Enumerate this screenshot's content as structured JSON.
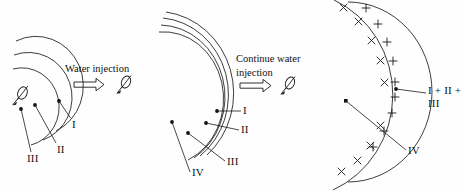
{
  "figure": {
    "background_color": "#fefefe",
    "ink_color": "#111111",
    "width": 463,
    "height": 193
  },
  "panel1": {
    "name": "initial-injection",
    "well_symbol": "well-slashed-circle",
    "arc_count": 3,
    "zone_labels": [
      {
        "id": "I",
        "text": "I"
      },
      {
        "id": "II",
        "text": "II"
      },
      {
        "id": "III",
        "text": "III"
      }
    ],
    "caption": "Water injection",
    "arrow": "block-arrow-right",
    "result_symbol": "well-slashed-circle"
  },
  "panel2": {
    "name": "continued-injection",
    "arc_count": 4,
    "zone_labels": [
      {
        "id": "I",
        "text": "I"
      },
      {
        "id": "II",
        "text": "II"
      },
      {
        "id": "III",
        "text": "III"
      },
      {
        "id": "IV",
        "text": "IV"
      }
    ],
    "caption_line1": "Continue water",
    "caption_line2": "injection",
    "arrow": "block-arrow-right",
    "result_symbol": "well-slashed-circle"
  },
  "panel3": {
    "name": "merged-front",
    "band": {
      "outer_fill_marks": "×",
      "inner_fill_marks": "+",
      "outer_mark_count": 9,
      "inner_mark_count": 9
    },
    "merged_label_line1": "I + II +",
    "merged_label_line2": "III",
    "zone_label_iv": "IV"
  }
}
